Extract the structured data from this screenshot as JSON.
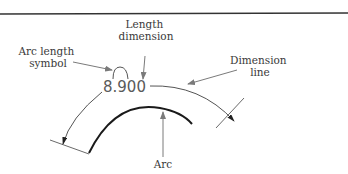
{
  "diagram": {
    "type": "arc length dimension illustration",
    "dimension_value": "8.900",
    "labels": {
      "length_dimension": [
        "Length",
        "dimension"
      ],
      "arc_length_symbol": [
        "Arc length",
        "symbol"
      ],
      "dimension_line": [
        "Dimension",
        "line"
      ],
      "arc": "Arc"
    },
    "colors": {
      "object_line": "#1a1a1a",
      "thin_line": "#6a6a6a",
      "leader": "#8a8a8a",
      "text": "#3a3a3a"
    }
  }
}
